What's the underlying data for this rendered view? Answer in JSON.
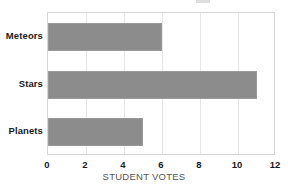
{
  "chart_data": {
    "type": "bar",
    "orientation": "horizontal",
    "title": "",
    "xlabel": "STUDENT VOTES",
    "ylabel": "",
    "categories": [
      "Meteors",
      "Stars",
      "Planets"
    ],
    "values": [
      6,
      11,
      5
    ],
    "series": [
      {
        "name": "Student votes",
        "values": [
          6,
          11,
          5
        ]
      }
    ],
    "xlim": [
      0,
      12
    ],
    "xticks": [
      0,
      2,
      4,
      6,
      8,
      10,
      12
    ],
    "xtick_labels": [
      "0",
      "2",
      "4",
      "6",
      "8",
      "10",
      "12"
    ],
    "grid": "vertical",
    "legend": "none",
    "bar_color": "#8c8c8c",
    "bar_edge_color": "#9a9a9a",
    "plot_border_color": "#d6d6d6",
    "gridline_color": "#e6e6e6",
    "background_color": "#ffffff",
    "tick_label_color": "#1a1a1a",
    "axis_title_color": "#555555"
  }
}
